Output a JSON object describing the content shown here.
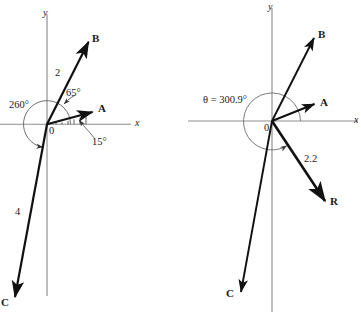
{
  "figure": {
    "kind": "vector-addition-diagram",
    "background": "#ffffff",
    "ink": "#111111",
    "axis_color": "#8c8c8c",
    "arc_color": "#7a7a7a"
  },
  "left_diagram": {
    "name": "vector-components-diagram",
    "origin_label": "0",
    "axes": {
      "x_label": "x",
      "y_label": "y"
    },
    "vectors": [
      {
        "id": "A",
        "label": "A",
        "angle_deg": 15,
        "magnitude_label": ""
      },
      {
        "id": "B",
        "label": "B",
        "angle_deg": 65,
        "magnitude_label": "2"
      },
      {
        "id": "C",
        "label": "C",
        "angle_deg": 260,
        "magnitude_label": "4"
      }
    ],
    "angle_marks": [
      {
        "id": "angle-15",
        "text": "15°"
      },
      {
        "id": "angle-65",
        "text": "65°"
      },
      {
        "id": "angle-260",
        "text": "260°"
      }
    ]
  },
  "right_diagram": {
    "name": "resultant-vector-diagram",
    "origin_label": "0",
    "axes": {
      "x_label": "x",
      "y_label": "y"
    },
    "vectors": [
      {
        "id": "A",
        "label": "A",
        "angle_deg": 15,
        "magnitude_label": ""
      },
      {
        "id": "B",
        "label": "B",
        "angle_deg": 65,
        "magnitude_label": ""
      },
      {
        "id": "C",
        "label": "C",
        "angle_deg": 260,
        "magnitude_label": ""
      },
      {
        "id": "R",
        "label": "R",
        "angle_deg": 300.9,
        "magnitude_label": "2.2"
      }
    ],
    "angle_marks": [
      {
        "id": "theta-resultant",
        "text": "θ = 300.9°"
      }
    ]
  }
}
